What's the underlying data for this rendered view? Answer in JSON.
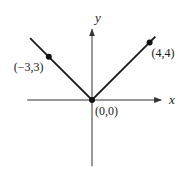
{
  "chart_data": {
    "type": "line",
    "title": "",
    "xlabel": "x",
    "ylabel": "y",
    "function": "|x|",
    "xlim": [
      -4.5,
      4.8
    ],
    "ylim": [
      -4.6,
      4.9
    ],
    "grid": false,
    "legend": "none",
    "series": [
      {
        "name": "y = |x|",
        "x": [
          -4.3,
          -3,
          0,
          4,
          4.4
        ],
        "y": [
          4.3,
          3,
          0,
          4,
          4.4
        ]
      }
    ],
    "points": [
      {
        "x": -3,
        "y": 3,
        "label": "(−3,3)",
        "label_side": "left"
      },
      {
        "x": 4,
        "y": 4,
        "label": "(4,4)",
        "label_side": "right"
      },
      {
        "x": 0,
        "y": 0,
        "label": "(0,0)",
        "label_side": "below-right"
      }
    ],
    "colors": {
      "line": "#1a1a1a",
      "axis": "#333333",
      "point": "#111111"
    }
  }
}
